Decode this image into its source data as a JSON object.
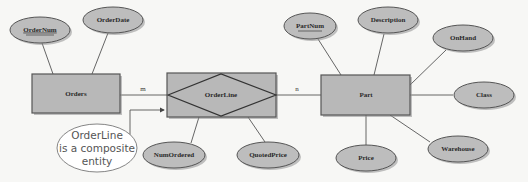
{
  "diagram": {
    "type": "entity-relationship",
    "entities": {
      "orders": {
        "label": "Orders"
      },
      "orderline": {
        "label": "OrderLine"
      },
      "part": {
        "label": "Part"
      }
    },
    "attributes": {
      "ordernum": {
        "label": "OrderNum",
        "key": true,
        "owner": "Orders"
      },
      "orderdate": {
        "label": "OrderDate",
        "key": false,
        "owner": "Orders"
      },
      "numordered": {
        "label": "NumOrdered",
        "key": false,
        "owner": "OrderLine"
      },
      "quotedprice": {
        "label": "QuotedPrice",
        "key": false,
        "owner": "OrderLine"
      },
      "partnum": {
        "label": "PartNum",
        "key": true,
        "owner": "Part"
      },
      "description": {
        "label": "Description",
        "key": false,
        "owner": "Part"
      },
      "onhand": {
        "label": "OnHand",
        "key": false,
        "owner": "Part"
      },
      "class": {
        "label": "Class",
        "key": false,
        "owner": "Part"
      },
      "price": {
        "label": "Price",
        "key": false,
        "owner": "Part"
      },
      "warehouse": {
        "label": "Warehouse",
        "key": false,
        "owner": "Part"
      }
    },
    "relationships": [
      {
        "from": "Orders",
        "to": "OrderLine",
        "cardinality": "m"
      },
      {
        "from": "OrderLine",
        "to": "Part",
        "cardinality": "n"
      }
    ],
    "cardinality_labels": {
      "orders_orderline": "m",
      "orderline_part": "n"
    },
    "callout": {
      "line1": "OrderLine",
      "line2": "is a composite",
      "line3": "entity",
      "target": "OrderLine"
    },
    "colors": {
      "entity_fill": "#b8b8b8",
      "attribute_fill": "#bdbdbd",
      "background": "#f7f7f5",
      "callout_fill": "#ffffff"
    }
  }
}
